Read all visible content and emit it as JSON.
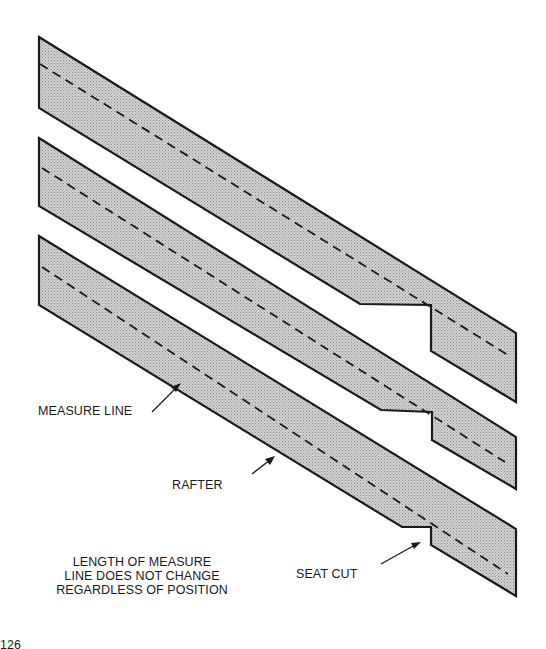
{
  "figure": {
    "labels": {
      "measure_line": "MEASURE LINE",
      "rafter": "RAFTER",
      "seat_cut": "SEAT CUT"
    },
    "caption": {
      "line1": "LENGTH OF MEASURE",
      "line2": "LINE DOES NOT CHANGE",
      "line3": "REGARDLESS OF POSITION"
    },
    "page_number": "126",
    "rafters": [
      {
        "name": "rafter-top",
        "seat_cut_depth": "deep"
      },
      {
        "name": "rafter-middle",
        "seat_cut_depth": "medium"
      },
      {
        "name": "rafter-bottom",
        "seat_cut_depth": "shallow"
      }
    ],
    "colors": {
      "outline": "#1a1a1a",
      "fill": "#c4c4c4",
      "background": "#ffffff"
    }
  }
}
